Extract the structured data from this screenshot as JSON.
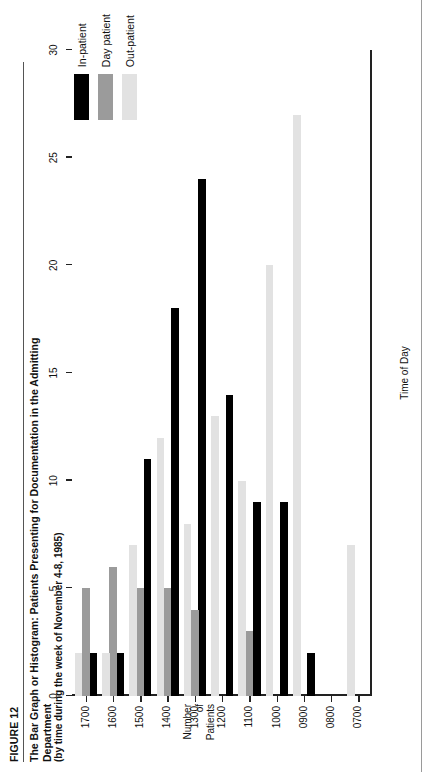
{
  "figure": {
    "label": "FIGURE 12",
    "title_line1": "The Bar Graph or Histogram: Patients Presenting for Documentation in the Admitting",
    "title_line2": "Department",
    "subtitle": "(by time during the week of November 4-8, 1985)"
  },
  "legend": {
    "position": "top-right",
    "items": [
      {
        "label": "In-patient",
        "color": "#000000"
      },
      {
        "label": "Day patient",
        "color": "#9b9b9b"
      },
      {
        "label": "Out-patient",
        "color": "#e2e2e2"
      }
    ]
  },
  "chart_data": {
    "type": "bar",
    "title": "The Bar Graph or Histogram: Patients Presenting for Documentation in the Admitting Department",
    "subtitle": "(by time during the week of November 4-8, 1985)",
    "xlabel": "Time of Day",
    "ylabel": "Number of Patients",
    "ylim": [
      0,
      30
    ],
    "yticks": [
      0,
      5,
      10,
      15,
      20,
      25,
      30
    ],
    "grid": false,
    "legend_position": "top-right",
    "categories": [
      "0700",
      "0800",
      "0900",
      "1000",
      "1100",
      "1200",
      "1300",
      "1400",
      "1500",
      "1600",
      "1700"
    ],
    "series": [
      {
        "name": "In-patient",
        "color": "#000000",
        "values": [
          0,
          0,
          2,
          9,
          9,
          14,
          24,
          18,
          11,
          2,
          2
        ]
      },
      {
        "name": "Day patient",
        "color": "#9b9b9b",
        "values": [
          0,
          0,
          0,
          0,
          3,
          0,
          4,
          5,
          5,
          6,
          5
        ]
      },
      {
        "name": "Out-patient",
        "color": "#e2e2e2",
        "values": [
          7,
          0,
          27,
          20,
          10,
          13,
          8,
          12,
          7,
          2,
          2
        ]
      }
    ]
  },
  "axes": {
    "y_ticks": [
      "0",
      "5",
      "10",
      "15",
      "20",
      "25",
      "30"
    ],
    "y_title_lines": [
      "Number",
      "of",
      "Patients"
    ],
    "x_ticks": [
      "0700",
      "0800",
      "0900",
      "1000",
      "1100",
      "1200",
      "1300",
      "1400",
      "1500",
      "1600",
      "1700"
    ],
    "x_title": "Time of Day"
  }
}
